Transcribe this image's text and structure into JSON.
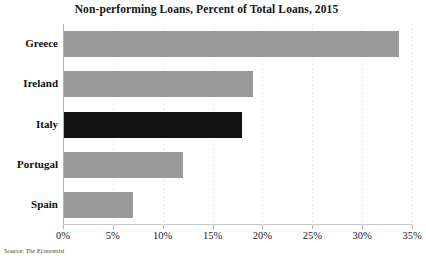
{
  "chart_data": {
    "type": "bar",
    "orientation": "horizontal",
    "title": "Non-performing Loans, Percent of Total Loans, 2015",
    "xlabel": "",
    "ylabel": "",
    "categories": [
      "Greece",
      "Ireland",
      "Italy",
      "Portugal",
      "Spain"
    ],
    "values": [
      33.6,
      19.0,
      17.9,
      11.9,
      6.9
    ],
    "value_suffix": "%",
    "xlim": [
      0,
      35
    ],
    "xticks": [
      0,
      5,
      10,
      15,
      20,
      25,
      30,
      35
    ],
    "xtick_labels": [
      "0%",
      "5%",
      "10%",
      "15%",
      "20%",
      "25%",
      "30%",
      "35%"
    ],
    "grid": true,
    "grid_axis": "x",
    "grid_style": "dotted",
    "legend": false,
    "highlight_category": "Italy",
    "colors": {
      "bar": "#9a9a9a",
      "bar_highlight": "#111111",
      "gridline": "#e9e9e9",
      "axis": "#b4b4b4",
      "text": "#0f0f0f"
    }
  },
  "source": {
    "label": "Source:",
    "name": "The Economist"
  }
}
